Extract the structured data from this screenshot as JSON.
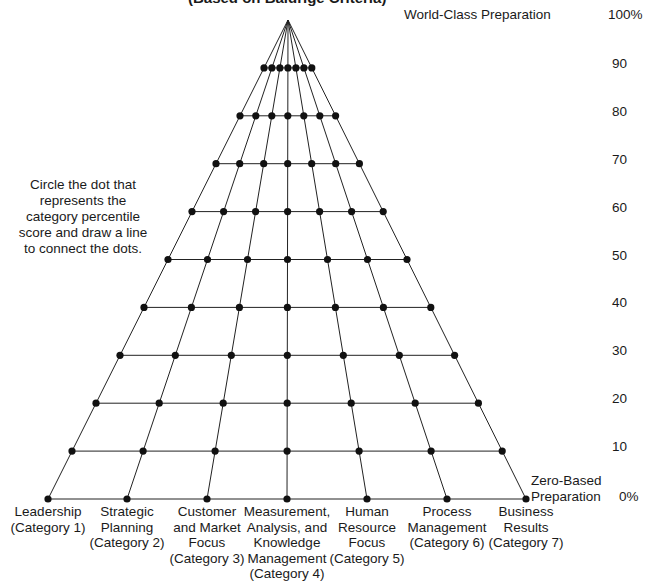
{
  "title": "(Based on Baldrige Criteria)",
  "top_label": "World-Class Preparation",
  "top_percent": "100%",
  "bottom_label_line1": "Zero-Based",
  "bottom_label_line2": "Preparation",
  "bottom_percent": "0%",
  "instructions": "Circle the dot that represents the category percentile score and draw a line to connect the dots.",
  "levels": [
    "90",
    "80",
    "70",
    "60",
    "50",
    "40",
    "30",
    "20",
    "10"
  ],
  "categories": [
    {
      "lines": [
        "Leadership",
        "(Category 1)"
      ]
    },
    {
      "lines": [
        "Strategic",
        "Planning",
        "(Category 2)"
      ]
    },
    {
      "lines": [
        "Customer",
        "and Market",
        "Focus",
        "(Category 3)"
      ]
    },
    {
      "lines": [
        "Measurement,",
        "Analysis, and",
        "Knowledge",
        "Management",
        "(Category 4)"
      ]
    },
    {
      "lines": [
        "Human",
        "Resource",
        "Focus",
        "(Category 5)"
      ]
    },
    {
      "lines": [
        "Process",
        "Management",
        "(Category 6)"
      ]
    },
    {
      "lines": [
        "Business",
        "Results",
        "(Category 7)"
      ]
    }
  ],
  "chart_data": {
    "type": "radar-like pyramid grid",
    "apex": [
      288,
      20
    ],
    "base_y": 499,
    "base_x": [
      48,
      127,
      207,
      287,
      367,
      447,
      526
    ],
    "levels_percent": [
      0,
      10,
      20,
      30,
      40,
      50,
      60,
      70,
      80,
      90,
      100
    ],
    "colors": {
      "line": "#222222",
      "dot": "#111111"
    }
  }
}
